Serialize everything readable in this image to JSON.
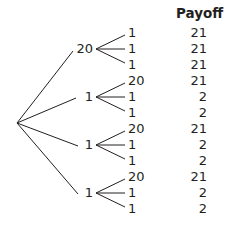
{
  "header": {
    "payoff_label": "Payoff"
  },
  "tree": {
    "root": "",
    "branches": [
      {
        "label": "20",
        "leaves": [
          {
            "label": "1",
            "payoff": "21"
          },
          {
            "label": "1",
            "payoff": "21"
          },
          {
            "label": "1",
            "payoff": "21"
          }
        ]
      },
      {
        "label": "1",
        "leaves": [
          {
            "label": "20",
            "payoff": "21"
          },
          {
            "label": "1",
            "payoff": "2"
          },
          {
            "label": "1",
            "payoff": "2"
          }
        ]
      },
      {
        "label": "1",
        "leaves": [
          {
            "label": "20",
            "payoff": "21"
          },
          {
            "label": "1",
            "payoff": "2"
          },
          {
            "label": "1",
            "payoff": "2"
          }
        ]
      },
      {
        "label": "1",
        "leaves": [
          {
            "label": "20",
            "payoff": "21"
          },
          {
            "label": "1",
            "payoff": "2"
          },
          {
            "label": "1",
            "payoff": "2"
          }
        ]
      }
    ]
  },
  "colors": {
    "ink": "#231f20",
    "background": "#ffffff"
  }
}
